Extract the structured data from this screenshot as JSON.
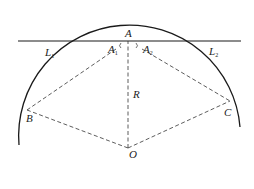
{
  "diagram": {
    "type": "geometry",
    "colors": {
      "solid": "#1a1a1a",
      "dashed": "#333333",
      "background": "#ffffff"
    },
    "points": {
      "A": {
        "label": "A",
        "x": 128,
        "y": 41
      },
      "A1": {
        "label": "A",
        "sub": "1",
        "x": 113,
        "y": 50
      },
      "A2": {
        "label": "A",
        "sub": "2",
        "x": 146,
        "y": 50
      },
      "B": {
        "label": "B",
        "x": 27,
        "y": 110
      },
      "C": {
        "label": "C",
        "x": 230,
        "y": 101
      },
      "O": {
        "label": "O",
        "x": 128,
        "y": 148
      }
    },
    "labels": {
      "A": "A",
      "A1_main": "A",
      "A1_sub": "1",
      "A2_main": "A",
      "A2_sub": "2",
      "L1_main": "L",
      "L1_sub": "1",
      "L2_main": "L",
      "L2_sub": "2",
      "R": "R",
      "B": "B",
      "C": "C",
      "O": "O"
    },
    "segments": [
      {
        "name": "tangent-line",
        "style": "solid",
        "from": [
          18,
          41
        ],
        "to": [
          241,
          41
        ]
      },
      {
        "name": "radius-OA",
        "style": "dashed",
        "from": "O",
        "to": "A"
      },
      {
        "name": "chord-AB",
        "style": "dashed",
        "from": "A",
        "to": "B"
      },
      {
        "name": "chord-AC",
        "style": "dashed",
        "from": "A",
        "to": "C"
      },
      {
        "name": "radius-OB",
        "style": "dashed",
        "from": "O",
        "to": "B"
      },
      {
        "name": "radius-OC",
        "style": "dashed",
        "from": "O",
        "to": "C"
      }
    ],
    "arcs": [
      {
        "name": "circle-arc",
        "style": "solid",
        "center": "O",
        "radius": 107,
        "from": [
          19,
          145
        ],
        "to": [
          240,
          127
        ]
      }
    ]
  }
}
